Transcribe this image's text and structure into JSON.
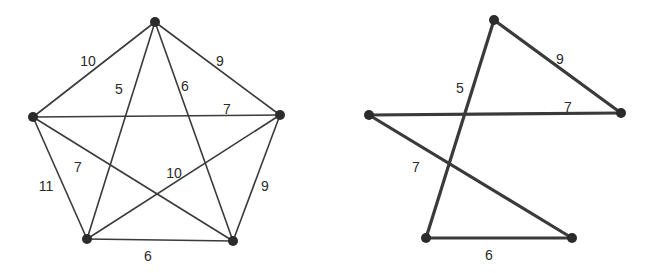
{
  "graphs": [
    {
      "name": "complete-graph",
      "vertices": [
        {
          "id": "A",
          "x": 155,
          "y": 22
        },
        {
          "id": "B",
          "x": 33,
          "y": 117
        },
        {
          "id": "C",
          "x": 280,
          "y": 115
        },
        {
          "id": "D",
          "x": 87,
          "y": 239
        },
        {
          "id": "E",
          "x": 233,
          "y": 241
        }
      ],
      "edges": [
        {
          "from": "A",
          "to": "B",
          "weight": "10",
          "lx": 88,
          "ly": 62
        },
        {
          "from": "A",
          "to": "C",
          "weight": "9",
          "lx": 220,
          "ly": 62
        },
        {
          "from": "A",
          "to": "D",
          "weight": "5",
          "lx": 119,
          "ly": 90
        },
        {
          "from": "A",
          "to": "E",
          "weight": "6",
          "lx": 185,
          "ly": 87
        },
        {
          "from": "B",
          "to": "C",
          "weight": "7",
          "lx": 227,
          "ly": 110
        },
        {
          "from": "B",
          "to": "D",
          "weight": "11",
          "lx": 46,
          "ly": 187
        },
        {
          "from": "B",
          "to": "E",
          "weight": "7",
          "lx": 78,
          "ly": 168
        },
        {
          "from": "C",
          "to": "D",
          "weight": "10",
          "lx": 174,
          "ly": 174
        },
        {
          "from": "C",
          "to": "E",
          "weight": "9",
          "lx": 265,
          "ly": 187
        },
        {
          "from": "D",
          "to": "E",
          "weight": "6",
          "lx": 148,
          "ly": 257
        }
      ],
      "stroke": "#3a3a3a",
      "stroke_width": 1.6
    },
    {
      "name": "hamiltonian-cycle",
      "vertices": [
        {
          "id": "A",
          "x": 494,
          "y": 20
        },
        {
          "id": "B",
          "x": 369,
          "y": 115
        },
        {
          "id": "C",
          "x": 621,
          "y": 113
        },
        {
          "id": "D",
          "x": 426,
          "y": 238
        },
        {
          "id": "E",
          "x": 572,
          "y": 238
        }
      ],
      "edges": [
        {
          "from": "A",
          "to": "C",
          "weight": "9",
          "lx": 560,
          "ly": 60
        },
        {
          "from": "A",
          "to": "D",
          "weight": "5",
          "lx": 460,
          "ly": 89
        },
        {
          "from": "B",
          "to": "C",
          "weight": "7",
          "lx": 568,
          "ly": 108
        },
        {
          "from": "B",
          "to": "E",
          "weight": "7",
          "lx": 416,
          "ly": 168
        },
        {
          "from": "D",
          "to": "E",
          "weight": "6",
          "lx": 489,
          "ly": 256
        }
      ],
      "stroke": "#3a3a3a",
      "stroke_width": 3.2
    }
  ],
  "colors": {
    "vertex": "#2b2b2b",
    "label": "#2a2a2a",
    "background": "#ffffff"
  }
}
